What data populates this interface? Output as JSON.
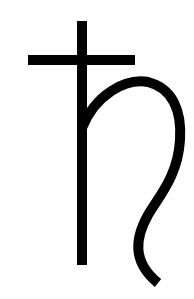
{
  "symbol": {
    "name": "Saturn symbol",
    "glyph": "♄",
    "stroke_color": "#000000",
    "background_color": "#ffffff"
  }
}
